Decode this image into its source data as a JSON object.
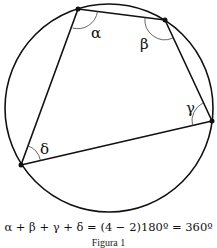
{
  "figure": {
    "circle": {
      "cx": 109,
      "cy": 108,
      "r": 104
    },
    "vertices": [
      {
        "id": "A",
        "x": 78,
        "y": 9
      },
      {
        "id": "B",
        "x": 165,
        "y": 20
      },
      {
        "id": "C",
        "x": 212,
        "y": 121
      },
      {
        "id": "D",
        "x": 21,
        "y": 165
      }
    ],
    "angle_labels": {
      "alpha": "α",
      "beta": "β",
      "gamma": "γ",
      "delta": "δ"
    },
    "stroke_color": "#111111"
  },
  "formula": "α + β + γ + δ = (4 − 2)180º = 360º",
  "caption": "Figura 1"
}
